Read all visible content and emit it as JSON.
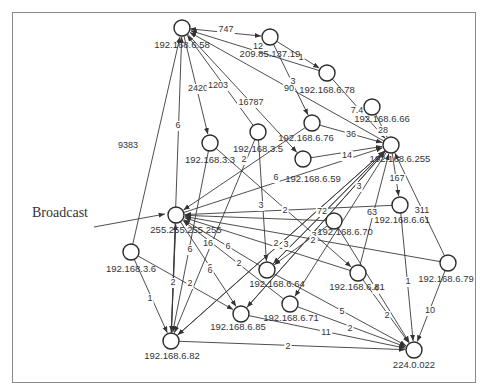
{
  "diagram": {
    "annotation": {
      "label": "Broadcast",
      "arrow_from": [
        94,
        227
      ],
      "arrow_to": [
        165,
        214
      ]
    },
    "node_radius": 8,
    "nodes": [
      {
        "id": "n658",
        "label": "192.168.6.58",
        "x": 182,
        "y": 28,
        "lx": 182,
        "ly": 48
      },
      {
        "id": "n209",
        "label": "209.85.137.19",
        "x": 270,
        "y": 37,
        "lx": 270,
        "ly": 57
      },
      {
        "id": "n678",
        "label": "192.168.6.78",
        "x": 327,
        "y": 73,
        "lx": 327,
        "ly": 93
      },
      {
        "id": "n666",
        "label": "192.168.6.66",
        "x": 372,
        "y": 107,
        "lx": 382,
        "ly": 122
      },
      {
        "id": "n676",
        "label": "192.168.6.76",
        "x": 312,
        "y": 123,
        "lx": 306,
        "ly": 141
      },
      {
        "id": "n35",
        "label": "192.168.3.5",
        "x": 258,
        "y": 132,
        "lx": 258,
        "ly": 152
      },
      {
        "id": "n33",
        "label": "192.168.3.3",
        "x": 210,
        "y": 143,
        "lx": 210,
        "ly": 163
      },
      {
        "id": "n659",
        "label": "192.168.6.59",
        "x": 303,
        "y": 159,
        "lx": 313,
        "ly": 182
      },
      {
        "id": "n6255",
        "label": "192.168.6.255",
        "x": 391,
        "y": 145,
        "lx": 400,
        "ly": 162
      },
      {
        "id": "n661",
        "label": "192.168.6.61",
        "x": 400,
        "y": 205,
        "lx": 402,
        "ly": 223
      },
      {
        "id": "n670",
        "label": "192.168.6.70",
        "x": 334,
        "y": 221,
        "lx": 345,
        "ly": 235
      },
      {
        "id": "nbc",
        "label": "255.255.255.255",
        "x": 176,
        "y": 215,
        "lx": 186,
        "ly": 233
      },
      {
        "id": "n36",
        "label": "192.168.3.6",
        "x": 131,
        "y": 252,
        "lx": 131,
        "ly": 272
      },
      {
        "id": "n664",
        "label": "192.168.6.64",
        "x": 267,
        "y": 270,
        "lx": 277,
        "ly": 287
      },
      {
        "id": "n681",
        "label": "192.168.6.81",
        "x": 358,
        "y": 273,
        "lx": 357,
        "ly": 290
      },
      {
        "id": "n679",
        "label": "192.168.6.79",
        "x": 448,
        "y": 263,
        "lx": 446,
        "ly": 282
      },
      {
        "id": "n671",
        "label": "192.168.6.71",
        "x": 290,
        "y": 304,
        "lx": 291,
        "ly": 321
      },
      {
        "id": "n685",
        "label": "192.168.6.85",
        "x": 241,
        "y": 314,
        "lx": 238,
        "ly": 330
      },
      {
        "id": "n682",
        "label": "192.168.6.82",
        "x": 171,
        "y": 341,
        "lx": 172,
        "ly": 359
      },
      {
        "id": "n224",
        "label": "224.0.022",
        "x": 414,
        "y": 350,
        "lx": 414,
        "ly": 368
      }
    ],
    "edges": [
      {
        "from": "n658",
        "to": "n209",
        "label": "747",
        "lx": 226,
        "ly": 30,
        "bidir": true
      },
      {
        "from": "n678",
        "to": "n658",
        "label": "12",
        "lx": 258,
        "ly": 47
      },
      {
        "from": "n209",
        "to": "n678",
        "label": "1",
        "lx": 301,
        "ly": 58
      },
      {
        "from": "n209",
        "to": "n676",
        "label": "3",
        "lx": 293,
        "ly": 82
      },
      {
        "from": "n6255",
        "to": "n658",
        "label": "90",
        "lx": 289,
        "ly": 89
      },
      {
        "from": "n36",
        "to": "n658",
        "label": "9383",
        "lx": 128,
        "ly": 146
      },
      {
        "from": "n682",
        "to": "n658",
        "label": "6",
        "lx": 178,
        "ly": 126
      },
      {
        "from": "n658",
        "to": "n33",
        "label": "2420",
        "lx": 198,
        "ly": 89
      },
      {
        "from": "n35",
        "to": "n658",
        "label": "1203",
        "lx": 218,
        "ly": 86
      },
      {
        "from": "n658",
        "to": "n659",
        "label": "16787",
        "lx": 251,
        "ly": 103
      },
      {
        "from": "n678",
        "to": "n6255",
        "label": "7.4",
        "lx": 357,
        "ly": 111
      },
      {
        "from": "n666",
        "to": "n6255",
        "label": "28",
        "lx": 383,
        "ly": 131
      },
      {
        "from": "n676",
        "to": "n6255",
        "label": "36",
        "lx": 351,
        "ly": 135
      },
      {
        "from": "n659",
        "to": "n6255",
        "label": "14",
        "lx": 347,
        "ly": 156
      },
      {
        "from": "n6255",
        "to": "n661",
        "label": "167",
        "lx": 397,
        "ly": 179
      },
      {
        "from": "n679",
        "to": "n6255",
        "label": "311",
        "lx": 422,
        "ly": 211
      },
      {
        "from": "n681",
        "to": "n6255",
        "label": "63",
        "lx": 372,
        "ly": 213
      },
      {
        "from": "n664",
        "to": "n6255",
        "label": "3",
        "lx": 359,
        "ly": 187
      },
      {
        "from": "n685",
        "to": "n6255",
        "label": "3",
        "lx": 314,
        "ly": 236
      },
      {
        "from": "n682",
        "to": "n6255",
        "label": "2",
        "lx": 313,
        "ly": 241
      },
      {
        "from": "nbc",
        "to": "n6255",
        "label": "",
        "lx": 0,
        "ly": 0
      },
      {
        "from": "n661",
        "to": "nbc",
        "label": "2",
        "lx": 285,
        "ly": 211
      },
      {
        "from": "n676",
        "to": "nbc",
        "label": "2",
        "lx": 244,
        "ly": 160
      },
      {
        "from": "n33",
        "to": "n681",
        "label": "6",
        "lx": 276,
        "ly": 178
      },
      {
        "from": "n35",
        "to": "n664",
        "label": "3",
        "lx": 261,
        "ly": 206
      },
      {
        "from": "n670",
        "to": "nbc",
        "label": "72",
        "lx": 322,
        "ly": 212
      },
      {
        "from": "n679",
        "to": "nbc",
        "label": "",
        "lx": 0,
        "ly": 0
      },
      {
        "from": "n671",
        "to": "nbc",
        "label": "16",
        "lx": 208,
        "ly": 244
      },
      {
        "from": "n681",
        "to": "nbc",
        "label": "6",
        "lx": 228,
        "ly": 247
      },
      {
        "from": "n664",
        "to": "nbc",
        "label": "2",
        "lx": 239,
        "ly": 264
      },
      {
        "from": "n682",
        "to": "nbc",
        "label": "2",
        "lx": 173,
        "ly": 283
      },
      {
        "from": "nbc",
        "to": "n682",
        "label": "",
        "lx": 0,
        "ly": 0
      },
      {
        "from": "n33",
        "to": "n682",
        "label": "6",
        "lx": 190,
        "ly": 250
      },
      {
        "from": "n35",
        "to": "n682",
        "label": "6",
        "lx": 210,
        "ly": 268
      },
      {
        "from": "n36",
        "to": "n682",
        "label": "1",
        "lx": 150,
        "ly": 299
      },
      {
        "from": "n36",
        "to": "n685",
        "label": "2",
        "lx": 190,
        "ly": 284
      },
      {
        "from": "nbc",
        "to": "n685",
        "label": "6",
        "lx": 210,
        "ly": 271
      },
      {
        "from": "n670",
        "to": "n664",
        "label": "2",
        "lx": 276,
        "ly": 244
      },
      {
        "from": "n6255",
        "to": "n664",
        "label": "3",
        "lx": 286,
        "ly": 245
      },
      {
        "from": "n6255",
        "to": "n685",
        "label": "",
        "lx": 0,
        "ly": 0
      },
      {
        "from": "n664",
        "to": "n224",
        "label": "5",
        "lx": 342,
        "ly": 312
      },
      {
        "from": "n671",
        "to": "n224",
        "label": "2",
        "lx": 350,
        "ly": 329
      },
      {
        "from": "n685",
        "to": "n224",
        "label": "11",
        "lx": 326,
        "ly": 333
      },
      {
        "from": "n682",
        "to": "n224",
        "label": "2",
        "lx": 288,
        "ly": 347
      },
      {
        "from": "n681",
        "to": "n224",
        "label": "2",
        "lx": 387,
        "ly": 316
      },
      {
        "from": "n670",
        "to": "n224",
        "label": "4",
        "lx": 376,
        "ly": 289
      },
      {
        "from": "n661",
        "to": "n224",
        "label": "1",
        "lx": 408,
        "ly": 282
      },
      {
        "from": "n679",
        "to": "n224",
        "label": "10",
        "lx": 430,
        "ly": 311
      },
      {
        "from": "n6255",
        "to": "n671",
        "label": "",
        "lx": 0,
        "ly": 0
      },
      {
        "from": "n6255",
        "to": "n682",
        "label": "",
        "lx": 0,
        "ly": 0
      }
    ]
  }
}
